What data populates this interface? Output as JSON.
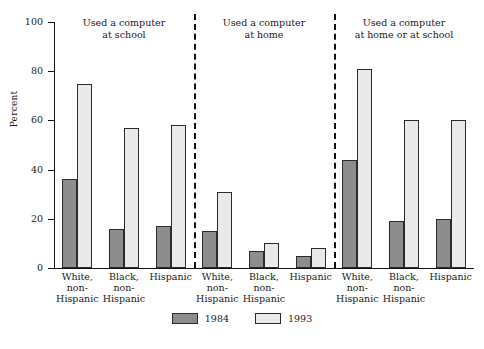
{
  "chart_data": {
    "type": "bar",
    "title": "",
    "xlabel": "",
    "ylabel": "Percent",
    "ylim": [
      0,
      100
    ],
    "yticks": [
      0,
      20,
      40,
      60,
      80,
      100
    ],
    "grid": false,
    "legend_position": "bottom",
    "categories": [
      "White, non-Hispanic",
      "Black, non-Hispanic",
      "Hispanic"
    ],
    "legend": [
      "1984",
      "1993"
    ],
    "panels": [
      {
        "title_line1": "Used a computer",
        "title_line2": "at school",
        "series": [
          {
            "name": "1984",
            "values": [
              36,
              16,
              17
            ]
          },
          {
            "name": "1993",
            "values": [
              75,
              57,
              58
            ]
          }
        ]
      },
      {
        "title_line1": "Used a computer",
        "title_line2": "at home",
        "series": [
          {
            "name": "1984",
            "values": [
              15,
              7,
              5
            ]
          },
          {
            "name": "1993",
            "values": [
              31,
              10,
              8
            ]
          }
        ]
      },
      {
        "title_line1": "Used a computer",
        "title_line2": "at home or at school",
        "series": [
          {
            "name": "1984",
            "values": [
              44,
              19,
              20
            ]
          },
          {
            "name": "1993",
            "values": [
              81,
              60,
              60
            ]
          }
        ]
      }
    ],
    "colors": {
      "y1984": "#8d8d8d",
      "y1993": "#e9e9e9",
      "axis": "#111111"
    }
  },
  "category_labels": [
    {
      "l1": "White,",
      "l2": "non-",
      "l3": "Hispanic"
    },
    {
      "l1": "Black,",
      "l2": "non-",
      "l3": "Hispanic"
    },
    {
      "l1": "Hispanic",
      "l2": "",
      "l3": ""
    }
  ]
}
